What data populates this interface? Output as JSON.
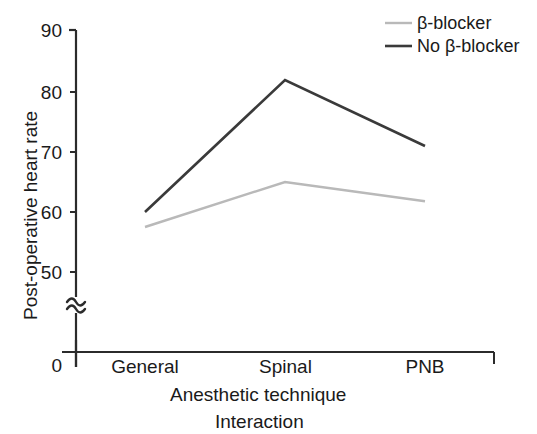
{
  "chart_data": {
    "type": "line",
    "title": "",
    "caption": "Interaction",
    "xlabel": "Anesthetic technique",
    "ylabel": "Post-operative heart rate",
    "categories": [
      "General",
      "Spinal",
      "PNB"
    ],
    "yticks": [
      50,
      60,
      70,
      80,
      90
    ],
    "ytick_labels": [
      "50",
      "60",
      "70",
      "80",
      "90"
    ],
    "origin_label": "0",
    "ylim": [
      50,
      90
    ],
    "axis_break": true,
    "axis_break_symbol": "≈",
    "grid": false,
    "legend_position": "top-right",
    "series": [
      {
        "name": "β-blocker",
        "color": "#b9b9b9",
        "values": [
          57.5,
          65.0,
          61.8
        ]
      },
      {
        "name": "No β-blocker",
        "color": "#3a3a3a",
        "values": [
          60.0,
          82.0,
          71.0
        ]
      }
    ]
  },
  "legend": {
    "items": [
      {
        "label": "β-blocker",
        "color": "#b9b9b9"
      },
      {
        "label": "No β-blocker",
        "color": "#3a3a3a"
      }
    ]
  },
  "axes": {
    "y_title": "Post-operative heart rate",
    "x_title": "Anesthetic technique",
    "y_tick_90": "90",
    "y_tick_80": "80",
    "y_tick_70": "70",
    "y_tick_60": "60",
    "y_tick_50": "50",
    "y_origin": "0",
    "x_tick_1": "General",
    "x_tick_2": "Spinal",
    "x_tick_3": "PNB"
  },
  "figure": {
    "caption": "Interaction"
  },
  "colors": {
    "axis": "#2b2b2b",
    "series_beta_blocker": "#b9b9b9",
    "series_no_beta_blocker": "#3a3a3a",
    "background": "#ffffff"
  }
}
